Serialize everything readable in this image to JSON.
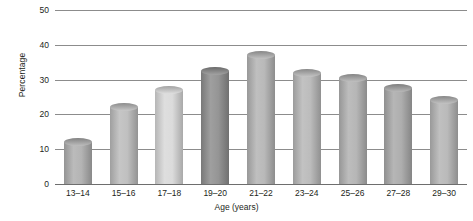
{
  "chart_data": {
    "type": "bar",
    "title": "",
    "xlabel": "Age (years)",
    "ylabel": "Percentage",
    "categories": [
      "13–14",
      "15–16",
      "17–18",
      "19–20",
      "21–22",
      "23–24",
      "25–26",
      "27–28",
      "29–30"
    ],
    "values": [
      12,
      22,
      27,
      32.5,
      37,
      32,
      30.5,
      27.5,
      24
    ],
    "ylim": [
      0,
      50
    ],
    "yticks": [
      0,
      10,
      20,
      30,
      40,
      50
    ],
    "ytick_labels": [
      "0",
      "10",
      "20",
      "30",
      "40",
      "50"
    ],
    "grid": true,
    "legend": "none",
    "bar_style": "cylinder",
    "bar_colors": [
      "#b0b0b0",
      "#bdbdbd",
      "#d9d9d9",
      "#8f8f8f",
      "#b5b5b5",
      "#b8b8b8",
      "#b2b2b2",
      "#aaaaaa",
      "#b6b6b6"
    ]
  },
  "axis": {
    "y_title": "Percentage",
    "x_title": "Age (years)"
  }
}
